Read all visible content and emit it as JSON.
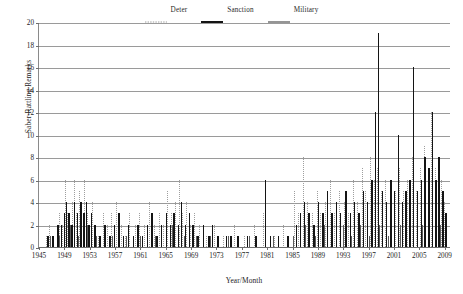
{
  "chart_data": {
    "type": "bar",
    "title": "",
    "xlabel": "Year/Month",
    "ylabel": "Saber-Rattling Remarks",
    "ylim": [
      0,
      20
    ],
    "ytick_step": 2,
    "yticks": [
      0,
      2,
      4,
      6,
      8,
      10,
      12,
      14,
      16,
      18,
      20
    ],
    "xlim": [
      1945,
      2010
    ],
    "xticks": [
      1945,
      1949,
      1953,
      1957,
      1961,
      1965,
      1969,
      1973,
      1977,
      1981,
      1985,
      1989,
      1993,
      1997,
      2001,
      2005,
      2009
    ],
    "grid": true,
    "legend_position": "top-center",
    "colors": {
      "deter": "#9e9e9e",
      "sanction": "#141414",
      "military": "#5c5c5c",
      "gridline": "#9a9a9a",
      "axis": "#6e6e6e",
      "background": "#ffffff"
    },
    "series": [
      {
        "name": "Deter",
        "style": "dotted",
        "points": [
          [
            1946.1,
            1
          ],
          [
            1946.6,
            2
          ],
          [
            1947.2,
            1
          ],
          [
            1947.8,
            2
          ],
          [
            1948.2,
            3
          ],
          [
            1948.7,
            2
          ],
          [
            1949.1,
            6
          ],
          [
            1949.4,
            3
          ],
          [
            1949.8,
            2
          ],
          [
            1950.2,
            4
          ],
          [
            1950.6,
            6
          ],
          [
            1950.9,
            3
          ],
          [
            1951.3,
            5
          ],
          [
            1951.7,
            4
          ],
          [
            1952.1,
            6
          ],
          [
            1952.5,
            3
          ],
          [
            1952.9,
            2
          ],
          [
            1953.3,
            4
          ],
          [
            1953.8,
            2
          ],
          [
            1954.3,
            1
          ],
          [
            1955.1,
            3
          ],
          [
            1955.7,
            2
          ],
          [
            1956.4,
            3
          ],
          [
            1957.2,
            4
          ],
          [
            1957.9,
            2
          ],
          [
            1958.5,
            1
          ],
          [
            1959.2,
            3
          ],
          [
            1960.1,
            2
          ],
          [
            1960.8,
            3
          ],
          [
            1961.5,
            2
          ],
          [
            1962.3,
            4
          ],
          [
            1963.1,
            2
          ],
          [
            1963.9,
            3
          ],
          [
            1964.6,
            2
          ],
          [
            1965.2,
            5
          ],
          [
            1965.8,
            3
          ],
          [
            1966.4,
            4
          ],
          [
            1967.1,
            6
          ],
          [
            1967.6,
            3
          ],
          [
            1968.2,
            4
          ],
          [
            1968.9,
            2
          ],
          [
            1969.5,
            3
          ],
          [
            1970.2,
            2
          ],
          [
            1971.4,
            1
          ],
          [
            1972.6,
            2
          ],
          [
            1974.1,
            1
          ],
          [
            1975.8,
            2
          ],
          [
            1977.3,
            1
          ],
          [
            1978.9,
            2
          ],
          [
            1980.4,
            3
          ],
          [
            1982.1,
            1
          ],
          [
            1983.5,
            2
          ],
          [
            1985.2,
            5
          ],
          [
            1985.9,
            3
          ],
          [
            1986.6,
            8
          ],
          [
            1987.3,
            4
          ],
          [
            1988.1,
            3
          ],
          [
            1988.8,
            5
          ],
          [
            1989.4,
            3
          ],
          [
            1990.2,
            4
          ],
          [
            1990.9,
            6
          ],
          [
            1991.5,
            3
          ],
          [
            1992.3,
            5
          ],
          [
            1993.1,
            4
          ],
          [
            1993.8,
            3
          ],
          [
            1994.5,
            6
          ],
          [
            1995.2,
            4
          ],
          [
            1995.9,
            7
          ],
          [
            1996.5,
            5
          ],
          [
            1997.2,
            8
          ],
          [
            1997.8,
            6
          ],
          [
            1998.3,
            7
          ],
          [
            1998.9,
            5
          ],
          [
            1999.6,
            6
          ],
          [
            2000.3,
            4
          ],
          [
            2001.1,
            5
          ],
          [
            2001.8,
            7
          ],
          [
            2002.4,
            5
          ],
          [
            2003.1,
            6
          ],
          [
            2003.8,
            8
          ],
          [
            2004.4,
            5
          ],
          [
            2005.1,
            7
          ],
          [
            2005.7,
            9
          ],
          [
            2006.3,
            6
          ],
          [
            2006.9,
            12
          ],
          [
            2007.4,
            7
          ],
          [
            2007.9,
            5
          ],
          [
            2008.4,
            6
          ],
          [
            2008.9,
            4
          ]
        ]
      },
      {
        "name": "Sanction",
        "style": "solid",
        "points": [
          [
            1946.3,
            1
          ],
          [
            1947.1,
            1
          ],
          [
            1947.9,
            2
          ],
          [
            1948.4,
            2
          ],
          [
            1948.9,
            3
          ],
          [
            1949.2,
            4
          ],
          [
            1949.6,
            3
          ],
          [
            1950.1,
            2
          ],
          [
            1950.5,
            4
          ],
          [
            1951.0,
            3
          ],
          [
            1951.5,
            4
          ],
          [
            1952.0,
            3
          ],
          [
            1952.4,
            4
          ],
          [
            1952.8,
            2
          ],
          [
            1953.2,
            3
          ],
          [
            1953.7,
            2
          ],
          [
            1954.5,
            1
          ],
          [
            1955.3,
            2
          ],
          [
            1956.1,
            1
          ],
          [
            1956.8,
            2
          ],
          [
            1957.5,
            3
          ],
          [
            1958.2,
            1
          ],
          [
            1959.0,
            2
          ],
          [
            1959.8,
            1
          ],
          [
            1960.5,
            2
          ],
          [
            1961.2,
            1
          ],
          [
            1962.0,
            2
          ],
          [
            1962.7,
            3
          ],
          [
            1963.5,
            1
          ],
          [
            1964.2,
            2
          ],
          [
            1965.0,
            3
          ],
          [
            1965.6,
            2
          ],
          [
            1966.2,
            3
          ],
          [
            1966.9,
            2
          ],
          [
            1967.4,
            4
          ],
          [
            1968.0,
            2
          ],
          [
            1968.6,
            3
          ],
          [
            1969.2,
            2
          ],
          [
            1970.0,
            1
          ],
          [
            1970.8,
            2
          ],
          [
            1971.7,
            1
          ],
          [
            1972.3,
            2
          ],
          [
            1973.1,
            1
          ],
          [
            1974.5,
            1
          ],
          [
            1975.2,
            1
          ],
          [
            1976.3,
            1
          ],
          [
            1977.8,
            1
          ],
          [
            1979.1,
            1
          ],
          [
            1980.6,
            6
          ],
          [
            1981.4,
            1
          ],
          [
            1982.7,
            1
          ],
          [
            1984.2,
            1
          ],
          [
            1985.5,
            2
          ],
          [
            1986.1,
            3
          ],
          [
            1986.8,
            4
          ],
          [
            1987.5,
            3
          ],
          [
            1988.3,
            2
          ],
          [
            1989.0,
            4
          ],
          [
            1989.7,
            3
          ],
          [
            1990.4,
            5
          ],
          [
            1991.1,
            3
          ],
          [
            1991.8,
            4
          ],
          [
            1992.5,
            3
          ],
          [
            1993.3,
            5
          ],
          [
            1994.0,
            3
          ],
          [
            1994.7,
            4
          ],
          [
            1995.4,
            3
          ],
          [
            1996.1,
            5
          ],
          [
            1996.7,
            4
          ],
          [
            1997.4,
            6
          ],
          [
            1998.0,
            12
          ],
          [
            1998.5,
            19
          ],
          [
            1999.1,
            5
          ],
          [
            1999.7,
            4
          ],
          [
            2000.4,
            6
          ],
          [
            2001.0,
            5
          ],
          [
            2001.6,
            10
          ],
          [
            2002.2,
            4
          ],
          [
            2002.8,
            5
          ],
          [
            2003.4,
            6
          ],
          [
            2004.0,
            16
          ],
          [
            2004.6,
            5
          ],
          [
            2005.2,
            6
          ],
          [
            2005.8,
            8
          ],
          [
            2006.4,
            7
          ],
          [
            2007.0,
            12
          ],
          [
            2007.5,
            6
          ],
          [
            2008.0,
            8
          ],
          [
            2008.6,
            5
          ],
          [
            2009.1,
            3
          ]
        ]
      },
      {
        "name": "Military",
        "style": "solid-gray",
        "points": [
          [
            1946.8,
            1
          ],
          [
            1948.1,
            1
          ],
          [
            1949.9,
            2
          ],
          [
            1951.2,
            1
          ],
          [
            1952.6,
            2
          ],
          [
            1954.0,
            1
          ],
          [
            1956.5,
            1
          ],
          [
            1958.8,
            1
          ],
          [
            1961.0,
            1
          ],
          [
            1963.3,
            1
          ],
          [
            1966.0,
            2
          ],
          [
            1967.9,
            1
          ],
          [
            1969.8,
            1
          ],
          [
            1972.0,
            1
          ],
          [
            1974.8,
            1
          ],
          [
            1978.2,
            1
          ],
          [
            1981.9,
            1
          ],
          [
            1985.0,
            1
          ],
          [
            1987.0,
            2
          ],
          [
            1988.5,
            1
          ],
          [
            1990.0,
            2
          ],
          [
            1991.3,
            1
          ],
          [
            1992.9,
            2
          ],
          [
            1994.2,
            1
          ],
          [
            1995.6,
            2
          ],
          [
            1997.0,
            1
          ],
          [
            1998.7,
            2
          ],
          [
            2000.0,
            1
          ],
          [
            2002.0,
            2
          ],
          [
            2003.6,
            1
          ],
          [
            2005.5,
            2
          ],
          [
            2006.6,
            1
          ],
          [
            2008.2,
            2
          ]
        ]
      }
    ]
  },
  "legend": {
    "items": [
      {
        "label": "Deter"
      },
      {
        "label": "Sanction"
      },
      {
        "label": "Military"
      }
    ]
  },
  "axes": {
    "y_title": "Saber-Rattling Remarks",
    "x_title": "Year/Month"
  }
}
